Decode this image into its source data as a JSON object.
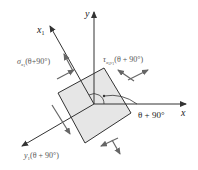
{
  "diagram": {
    "axes": {
      "x_label": "x",
      "y_label": "y",
      "x1_label": "x",
      "x1_sub": "1",
      "y1_label": "y",
      "y1_sub": "1"
    },
    "labels": {
      "sigma": "σ",
      "sigma_sub": "x",
      "sigma_subsub": "1",
      "sigma_arg": "(θ+90°)",
      "tau": "τ",
      "tau_sub": "x",
      "tau_sub1": "1",
      "tau_sub2": "y",
      "tau_sub3": "1",
      "tau_arg": "(θ + 90°)",
      "y1_arg": "(θ + 90°)",
      "angle": "θ + 90°"
    },
    "colors": {
      "element_fill": "#e6e6e6",
      "line": "#333333",
      "arrow": "#555555"
    }
  }
}
